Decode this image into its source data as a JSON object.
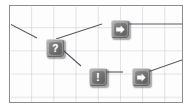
{
  "diagram": {
    "canvas": {
      "background_color": "#fdfdfd",
      "border_color": "#8c8c8c",
      "grid_visible": true,
      "grid_color": "#96a0af",
      "grid_spacing_x": 22,
      "grid_spacing_y": 23
    },
    "node_style": {
      "fill_color": "#a3a3a3",
      "inner_color": "#6f6f70",
      "glyph_color": "#fdfdfd",
      "shadow_color": "#282a2d"
    },
    "edge_style": {
      "color": "#5a5a60",
      "width": 1
    },
    "nodes": [
      {
        "id": "n1",
        "label": "",
        "icon": "question-mark-icon",
        "glyph": "?",
        "x": 36,
        "y": 33
      },
      {
        "id": "n2",
        "label": "",
        "icon": "arrow-right-icon",
        "glyph": "",
        "x": 101,
        "y": 14
      },
      {
        "id": "n3",
        "label": "",
        "icon": "exclamation-mark-icon",
        "glyph": "!",
        "x": 79,
        "y": 62
      },
      {
        "id": "n4",
        "label": "",
        "icon": "arrow-right-icon",
        "glyph": "",
        "x": 122,
        "y": 62
      }
    ],
    "edges": [
      {
        "id": "e-in",
        "from": "canvas-left-edge",
        "to": "n1"
      },
      {
        "id": "e1",
        "from": "n1",
        "to": "n2"
      },
      {
        "id": "e2",
        "from": "n1",
        "to": "n3"
      },
      {
        "id": "e3",
        "from": "n3",
        "to": "n4"
      },
      {
        "id": "e4",
        "from": "n2",
        "to": "canvas-right-edge"
      },
      {
        "id": "e5",
        "from": "n4",
        "to": "canvas-right-edge"
      }
    ]
  }
}
